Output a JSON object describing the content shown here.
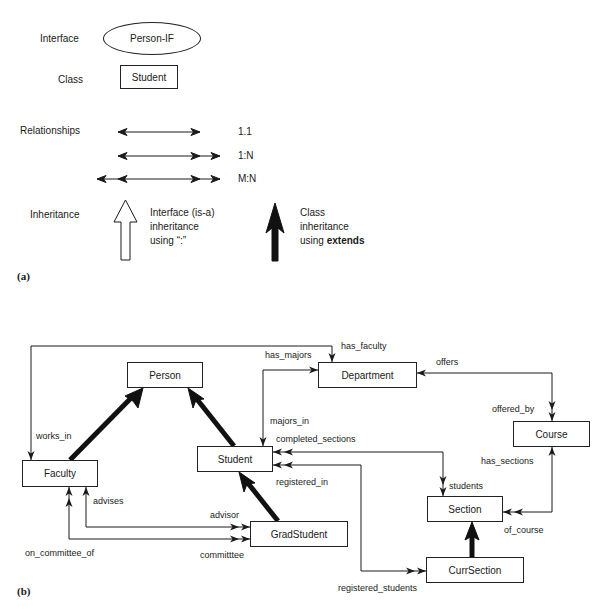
{
  "legend": {
    "panel_tag": "(a)",
    "interface": {
      "label": "Interface",
      "example": "Person-IF"
    },
    "class": {
      "label": "Class",
      "example": "Student"
    },
    "relationships": {
      "label": "Relationships",
      "items": [
        {
          "kind": "1.1"
        },
        {
          "kind": "1:N"
        },
        {
          "kind": "M:N"
        }
      ]
    },
    "inheritance": {
      "label": "Inheritance",
      "interface_text": [
        "Interface (is-a)",
        "inheritance",
        "using “:”"
      ],
      "class_text": [
        "Class",
        "inheritance",
        "using "
      ],
      "class_keyword": "extends"
    }
  },
  "diagram": {
    "panel_tag": "(b)",
    "classes": {
      "person": "Person",
      "department": "Department",
      "course": "Course",
      "faculty": "Faculty",
      "student": "Student",
      "section": "Section",
      "grad_student": "GradStudent",
      "curr_section": "CurrSection"
    },
    "relationship_labels": {
      "has_faculty": "has_faculty",
      "works_in": "works_in",
      "has_majors": "has_majors",
      "majors_in": "majors_in",
      "offers": "offers",
      "offered_by": "offered_by",
      "completed_sections": "completed_sections",
      "students": "students",
      "registered_in": "registered_in",
      "registered_students": "registered_students",
      "has_sections": "has_sections",
      "of_course": "of_course",
      "advises": "advises",
      "advisor": "advisor",
      "on_committee_of": "on_committee_of",
      "committee": "committtee"
    },
    "inheritance": [
      {
        "child": "Faculty",
        "parent": "Person",
        "type": "class"
      },
      {
        "child": "Student",
        "parent": "Person",
        "type": "class"
      },
      {
        "child": "GradStudent",
        "parent": "Student",
        "type": "class"
      },
      {
        "child": "CurrSection",
        "parent": "Section",
        "type": "class"
      }
    ],
    "relationships": [
      {
        "from": "Faculty",
        "to": "Department",
        "names": [
          "works_in",
          "has_faculty"
        ],
        "cardinality": "1:N"
      },
      {
        "from": "Student",
        "to": "Department",
        "names": [
          "majors_in",
          "has_majors"
        ],
        "cardinality": "1:N"
      },
      {
        "from": "Department",
        "to": "Course",
        "names": [
          "offers",
          "offered_by"
        ],
        "cardinality": "1:N"
      },
      {
        "from": "Student",
        "to": "Section",
        "names": [
          "completed_sections",
          "students"
        ],
        "cardinality": "M:N"
      },
      {
        "from": "Student",
        "to": "CurrSection",
        "names": [
          "registered_in",
          "registered_students"
        ],
        "cardinality": "M:N"
      },
      {
        "from": "Course",
        "to": "Section",
        "names": [
          "has_sections",
          "of_course"
        ],
        "cardinality": "1:N"
      },
      {
        "from": "Faculty",
        "to": "GradStudent",
        "names": [
          "advises",
          "advisor"
        ],
        "cardinality": "1:N"
      },
      {
        "from": "Faculty",
        "to": "GradStudent",
        "names": [
          "on_committee_of",
          "committtee"
        ],
        "cardinality": "M:N"
      }
    ]
  }
}
